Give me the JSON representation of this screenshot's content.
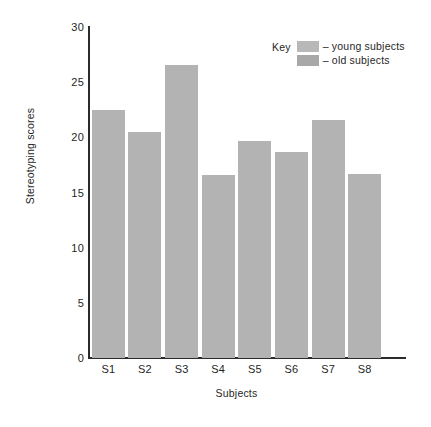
{
  "chart_data": {
    "type": "bar",
    "title": "",
    "subtitle": "",
    "xlabel": "Subjects",
    "ylabel": "Stereotyping scores",
    "categories": [
      "S1",
      "S2",
      "S3",
      "S4",
      "S5",
      "S6",
      "S7",
      "S8"
    ],
    "values": [
      22.5,
      20.5,
      26.6,
      16.6,
      19.7,
      18.7,
      21.6,
      16.7
    ],
    "series": [
      {
        "name": "young subjects",
        "values": [
          22.5,
          20.5,
          26.6,
          16.6,
          19.7,
          18.7,
          21.6,
          16.7
        ]
      }
    ],
    "ylim": [
      0,
      30
    ],
    "yticks": [
      0,
      5,
      10,
      15,
      20,
      25,
      30
    ],
    "ytick_labels": [
      "0",
      "5",
      "10",
      "15",
      "20",
      "25",
      "30"
    ],
    "grid": false,
    "legend_position": "top-right",
    "bar_color": "#b3b3b3",
    "axis_color": "#2b2b2b",
    "background": "#ffffff"
  },
  "axes": {
    "y_title": "Stereotyping scores",
    "x_title": "Subjects",
    "y_tick_labels": [
      "30",
      "25",
      "20",
      "15",
      "10",
      "5",
      "0"
    ],
    "x_tick_labels": [
      "S1",
      "S2",
      "S3",
      "S4",
      "S5",
      "S6",
      "S7",
      "S8"
    ]
  },
  "legend": {
    "title": "Key",
    "entries": [
      {
        "label": "– young subjects",
        "color": "#b8b8b8"
      },
      {
        "label": "– old subjects",
        "color": "#a8a8a8"
      }
    ]
  }
}
